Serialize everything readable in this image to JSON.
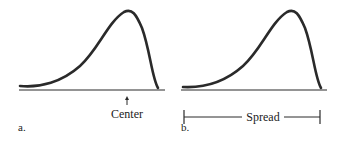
{
  "figure": {
    "panels": [
      {
        "id": "a",
        "label": "a.",
        "annotation": "Center",
        "annotation_type": "arrow"
      },
      {
        "id": "b",
        "label": "b.",
        "annotation": "Spread",
        "annotation_type": "range-bar"
      }
    ],
    "colors": {
      "stroke": "#2a2a2a",
      "text": "#222222",
      "background": "#ffffff"
    }
  }
}
